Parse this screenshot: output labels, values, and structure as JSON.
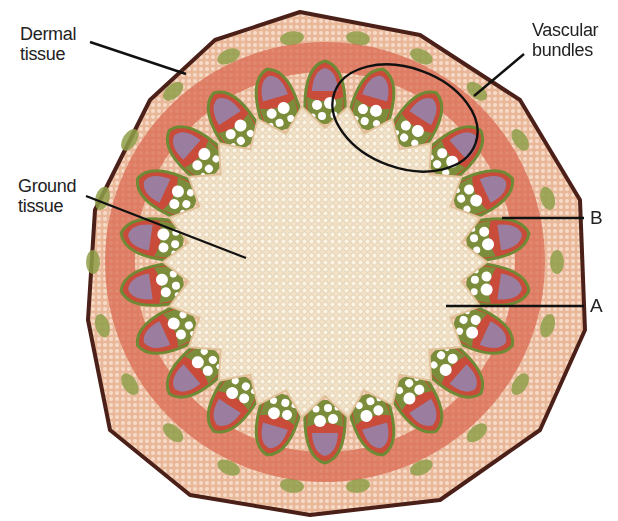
{
  "labels": {
    "dermal": {
      "line1": "Dermal",
      "line2": "tissue"
    },
    "vascular": {
      "line1": "Vascular",
      "line2": "bundles"
    },
    "ground": {
      "line1": "Ground",
      "line2": "tissue"
    },
    "b": "B",
    "a": "A"
  },
  "colors": {
    "epidermis": "#5a2a22",
    "cortex": "#efc6a6",
    "cortex_red": "#d9604a",
    "phloem": "#9b7c9c",
    "xylem_green": "#7f8f3a",
    "pith": "#f4e4cc",
    "line": "#111111"
  }
}
